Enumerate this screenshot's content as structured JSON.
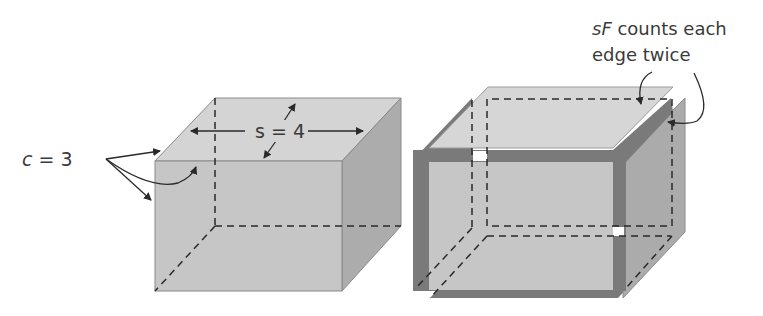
{
  "left_cube": {
    "corner_label": {
      "var": "c",
      "eq": " = 3"
    },
    "edge_label": {
      "var": "s",
      "eq": " = 4"
    }
  },
  "right_cube": {
    "annotation_line1": {
      "var": "sF",
      "rest": " counts each"
    },
    "annotation_line2": "edge twice"
  },
  "colors": {
    "top_face": "#d4d4d4",
    "front_face": "#c6c6c6",
    "side_face": "#ababab",
    "edge_strip": "#7a7a7a",
    "line": "#2a2a2a"
  }
}
